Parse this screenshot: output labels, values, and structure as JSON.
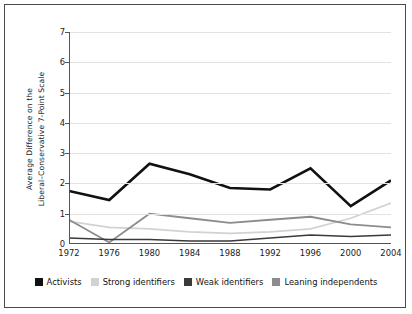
{
  "chart_data": {
    "type": "line",
    "title": "",
    "xlabel": "",
    "ylabel": "Average  Difference on the Liberal–Conservative 7-Point Scale",
    "ylabel_line1": "Average  Difference on the",
    "ylabel_line2": "Liberal–Conservative 7-Point Scale",
    "categories": [
      "1972",
      "1976",
      "1980",
      "1984",
      "1988",
      "1992",
      "1996",
      "2000",
      "2004"
    ],
    "x": [
      1972,
      1976,
      1980,
      1984,
      1988,
      1992,
      1996,
      2000,
      2004
    ],
    "ylim": [
      0,
      7
    ],
    "yticks": [
      0,
      1,
      2,
      3,
      4,
      5,
      6,
      7
    ],
    "ytick_labels": [
      "0",
      "1",
      "2",
      "3",
      "4",
      "5",
      "6",
      "7"
    ],
    "grid": true,
    "grid_axis": "y",
    "legend_position": "bottom",
    "series": [
      {
        "name": "Activists",
        "color": "#111111",
        "width": 2.6,
        "values": [
          1.75,
          1.45,
          2.65,
          2.3,
          1.85,
          1.8,
          2.5,
          1.25,
          2.1
        ]
      },
      {
        "name": "Strong identifiers",
        "color": "#d2d2d2",
        "width": 1.8,
        "values": [
          0.75,
          0.55,
          0.5,
          0.4,
          0.35,
          0.4,
          0.5,
          0.85,
          1.35
        ]
      },
      {
        "name": "Weak identifiers",
        "color": "#3a3a3a",
        "width": 1.5,
        "values": [
          0.2,
          0.15,
          0.15,
          0.1,
          0.1,
          0.2,
          0.3,
          0.25,
          0.3
        ]
      },
      {
        "name": "Leaning independents",
        "color": "#8c8c8c",
        "width": 1.8,
        "values": [
          0.8,
          0.05,
          1.0,
          0.85,
          0.7,
          0.8,
          0.9,
          0.65,
          0.55
        ]
      }
    ]
  },
  "legend": {
    "items": [
      {
        "label": "Activists",
        "color": "#111111"
      },
      {
        "label": "Strong identifiers",
        "color": "#d2d2d2"
      },
      {
        "label": "Weak identifiers",
        "color": "#3a3a3a"
      },
      {
        "label": "Leaning independents",
        "color": "#8c8c8c"
      }
    ]
  }
}
